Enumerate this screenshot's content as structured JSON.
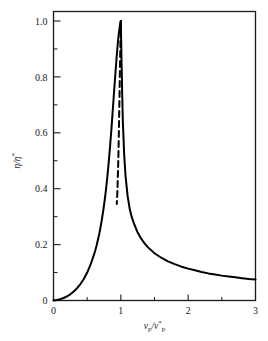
{
  "chart_data": {
    "type": "line",
    "title": "",
    "subtitle": "",
    "xlabel": "v_p/v_p*",
    "ylabel": "η/η*",
    "xlabel_parts": {
      "base1": "v",
      "sub1": "p",
      "slash": "/",
      "base2": "v",
      "sub2": "p",
      "sup2": "*"
    },
    "ylabel_parts": {
      "base1": "η",
      "slash": "/",
      "base2": "η",
      "sup2": "*"
    },
    "xlim": [
      0,
      3
    ],
    "ylim": [
      0,
      1.05
    ],
    "xticks": [
      0,
      1,
      2,
      3
    ],
    "xticklabels": [
      "0",
      "1",
      "2",
      "3"
    ],
    "yticks": [
      0,
      0.2,
      0.4,
      0.6,
      0.8,
      1.0
    ],
    "yticklabels": [
      "0",
      "0.2",
      "0.4",
      "0.6",
      "0.8",
      "1.0"
    ],
    "x_minor_ticks": [
      0.5,
      1.5,
      2.5
    ],
    "y_minor_ticks": [
      0.1,
      0.3,
      0.5,
      0.7,
      0.9
    ],
    "grid": false,
    "legend": null,
    "frame": "box",
    "series": [
      {
        "name": "eta-ratio-solid",
        "style": "solid",
        "color": "#000000",
        "linewidth": 2.0,
        "x": [
          0.0,
          0.05,
          0.1,
          0.15,
          0.2,
          0.25,
          0.3,
          0.35,
          0.4,
          0.45,
          0.5,
          0.55,
          0.6,
          0.62,
          0.64,
          0.66,
          0.68,
          0.7,
          0.72,
          0.74,
          0.76,
          0.78,
          0.8,
          0.82,
          0.84,
          0.86,
          0.88,
          0.9,
          0.92,
          0.94,
          0.95,
          0.96,
          0.97,
          0.98,
          0.985,
          0.99,
          0.995,
          1.0
        ],
        "y": [
          0.0,
          0.002,
          0.005,
          0.009,
          0.015,
          0.022,
          0.032,
          0.044,
          0.059,
          0.077,
          0.1,
          0.128,
          0.163,
          0.179,
          0.197,
          0.217,
          0.239,
          0.264,
          0.292,
          0.323,
          0.358,
          0.398,
          0.443,
          0.494,
          0.551,
          0.613,
          0.68,
          0.748,
          0.815,
          0.878,
          0.906,
          0.932,
          0.955,
          0.974,
          0.982,
          0.989,
          0.996,
          1.0
        ]
      },
      {
        "name": "eta-ratio-solid-descending",
        "style": "solid",
        "color": "#000000",
        "linewidth": 2.0,
        "x": [
          1.0,
          1.005,
          1.01,
          1.02,
          1.03,
          1.05,
          1.07,
          1.1,
          1.13,
          1.16,
          1.2,
          1.25,
          1.3,
          1.35,
          1.4,
          1.5,
          1.6,
          1.7,
          1.8,
          1.9,
          2.0,
          2.1,
          2.2,
          2.3,
          2.4,
          2.5,
          2.6,
          2.7,
          2.8,
          2.9,
          3.0
        ],
        "y": [
          1.0,
          0.93,
          0.86,
          0.74,
          0.64,
          0.52,
          0.445,
          0.375,
          0.33,
          0.3,
          0.272,
          0.243,
          0.222,
          0.205,
          0.191,
          0.169,
          0.153,
          0.14,
          0.13,
          0.121,
          0.114,
          0.108,
          0.102,
          0.097,
          0.093,
          0.089,
          0.086,
          0.083,
          0.08,
          0.077,
          0.075
        ]
      },
      {
        "name": "metastable-branch-dashed",
        "style": "dashed",
        "color": "#000000",
        "linewidth": 2.0,
        "x": [
          1.0,
          0.995,
          0.99,
          0.985,
          0.98,
          0.975,
          0.97,
          0.965,
          0.96,
          0.955,
          0.95,
          0.945,
          0.94
        ],
        "y": [
          1.0,
          0.94,
          0.87,
          0.8,
          0.73,
          0.66,
          0.59,
          0.53,
          0.48,
          0.44,
          0.4,
          0.37,
          0.345
        ]
      }
    ],
    "annotations": []
  }
}
